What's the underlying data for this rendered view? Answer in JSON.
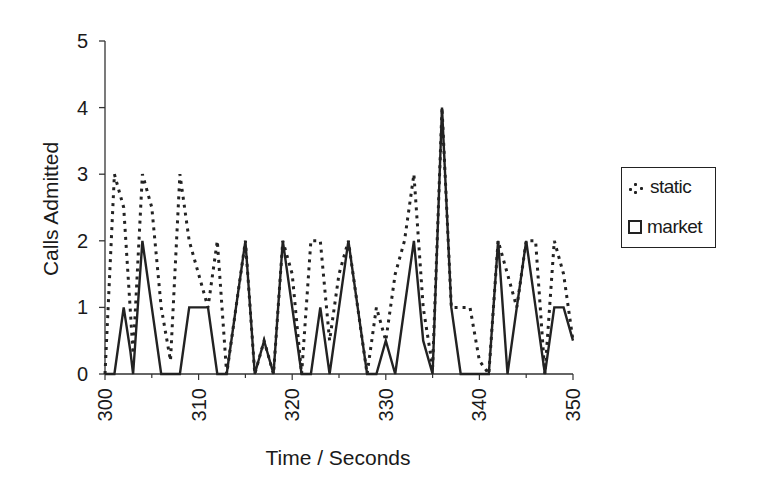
{
  "chart_data": {
    "type": "line",
    "title": "",
    "xlabel": "Time / Seconds",
    "ylabel": "Calls Admitted",
    "xlim": [
      300,
      350
    ],
    "ylim": [
      0,
      5
    ],
    "x_ticks": [
      "300",
      "310",
      "320",
      "330",
      "340",
      "350"
    ],
    "y_ticks": [
      "0",
      "1",
      "2",
      "3",
      "4",
      "5"
    ],
    "grid": false,
    "legend_position": "right",
    "legend": [
      "static",
      "market"
    ],
    "series": [
      {
        "name": "static",
        "style": "dotted",
        "x": [
          300,
          301,
          302,
          303,
          304,
          305,
          306,
          307,
          308,
          309,
          310,
          311,
          312,
          313,
          314,
          315,
          316,
          317,
          318,
          319,
          320,
          321,
          322,
          323,
          324,
          325,
          326,
          327,
          328,
          329,
          330,
          331,
          332,
          333,
          334,
          335,
          336,
          337,
          338,
          339,
          340,
          341,
          342,
          343,
          344,
          345,
          346,
          347,
          348,
          349,
          350
        ],
        "values": [
          0,
          3,
          2.5,
          0.3,
          3,
          2.5,
          1,
          0.2,
          3,
          2,
          1.5,
          1,
          2,
          0,
          1,
          2,
          0,
          0.5,
          0,
          2,
          1.5,
          0,
          2,
          2,
          0.5,
          1.5,
          2,
          1,
          0,
          1,
          0.5,
          1.5,
          2,
          3,
          1,
          0.1,
          4,
          1,
          1,
          1,
          0.2,
          0,
          2,
          1.5,
          1,
          2,
          2,
          0,
          2,
          1.5,
          0.5
        ]
      },
      {
        "name": "market",
        "style": "solid",
        "x": [
          300,
          301,
          302,
          302.7,
          303,
          304,
          305,
          306,
          307,
          308,
          309,
          310,
          311,
          312,
          313,
          314,
          315,
          316,
          317,
          318,
          319,
          320,
          321,
          322,
          323,
          324,
          325,
          326,
          327,
          328,
          329,
          330,
          331,
          332,
          333,
          334,
          335,
          336,
          337,
          338,
          339,
          340,
          341,
          342,
          343,
          344,
          345,
          346,
          347,
          348,
          349,
          350
        ],
        "values": [
          0,
          0,
          1,
          0.35,
          0,
          2,
          1,
          0,
          0,
          0,
          1,
          1,
          1,
          0,
          0,
          1,
          2,
          0,
          0.5,
          0,
          2,
          1,
          0,
          0,
          1,
          0,
          1,
          2,
          1,
          0,
          0,
          0.5,
          0,
          1,
          2,
          0.5,
          0,
          4,
          1,
          0,
          0,
          0,
          0,
          2,
          0,
          1,
          2,
          1,
          0,
          1,
          1,
          0.5
        ]
      }
    ]
  }
}
